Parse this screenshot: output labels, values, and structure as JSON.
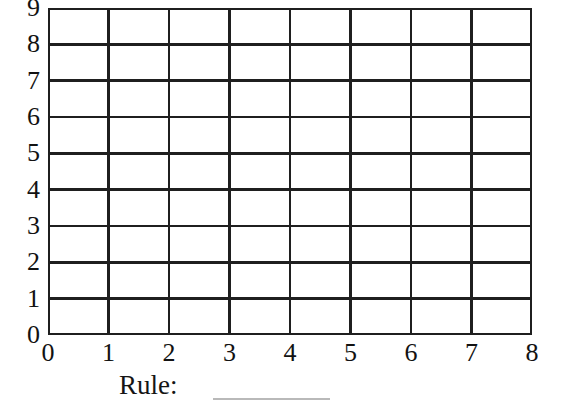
{
  "worksheet": {
    "rule_prompt": "Rule:",
    "rule_answer": ""
  },
  "chart_data": {
    "type": "table",
    "title": "",
    "xlabel": "",
    "ylabel": "",
    "xlim": [
      0,
      8
    ],
    "ylim": [
      0,
      9
    ],
    "x_ticks": [
      "0",
      "1",
      "2",
      "3",
      "4",
      "5",
      "6",
      "7",
      "8"
    ],
    "y_ticks": [
      "9",
      "8",
      "7",
      "6",
      "5",
      "4",
      "3",
      "2",
      "1",
      "0"
    ],
    "columns": 8,
    "rows": 9,
    "grid": true,
    "legend": null,
    "series": [],
    "values": [],
    "annotations": [],
    "grid_color": "#1f1f1f",
    "background_color": "#ffffff"
  }
}
